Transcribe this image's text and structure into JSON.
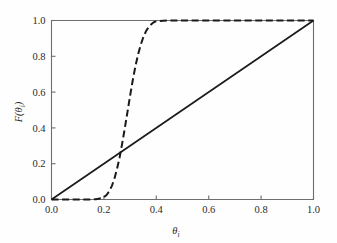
{
  "chart_data": {
    "type": "line",
    "title": "",
    "xlabel": "θi",
    "xlabel_base": "θ",
    "xlabel_sub": "i",
    "ylabel": "F(θi)",
    "ylabel_parts": {
      "func": "F",
      "open": "(",
      "base": "θ",
      "sub": "i",
      "close": ")"
    },
    "xlim": [
      0.0,
      1.0
    ],
    "ylim": [
      0.0,
      1.0
    ],
    "xticks": [
      0.0,
      0.2,
      0.4,
      0.6,
      0.8,
      1.0
    ],
    "yticks": [
      0.0,
      0.2,
      0.4,
      0.6,
      0.8,
      1.0
    ],
    "xtick_labels": [
      "0.0",
      "0.2",
      "0.4",
      "0.6",
      "0.8",
      "1.0"
    ],
    "ytick_labels": [
      "0.0",
      "0.2",
      "0.4",
      "0.6",
      "0.8",
      "1.0"
    ],
    "grid": false,
    "legend": false,
    "legend_position": "none",
    "series": [
      {
        "name": "identity",
        "style": "solid",
        "color": "#1a1a1a",
        "x": [
          0.0,
          1.0
        ],
        "values": [
          0.0,
          1.0
        ]
      },
      {
        "name": "steep-cdf",
        "style": "dashed",
        "color": "#1a1a1a",
        "x": [
          0.0,
          0.05,
          0.1,
          0.14,
          0.17,
          0.19,
          0.2,
          0.21,
          0.22,
          0.23,
          0.24,
          0.25,
          0.26,
          0.27,
          0.28,
          0.29,
          0.3,
          0.31,
          0.32,
          0.33,
          0.34,
          0.35,
          0.36,
          0.37,
          0.38,
          0.39,
          0.4,
          0.45,
          0.55,
          0.7,
          0.85,
          1.0
        ],
        "values": [
          0.0,
          0.0,
          0.0,
          0.0,
          0.002,
          0.007,
          0.013,
          0.025,
          0.045,
          0.075,
          0.115,
          0.17,
          0.235,
          0.315,
          0.4,
          0.49,
          0.58,
          0.665,
          0.742,
          0.808,
          0.862,
          0.905,
          0.938,
          0.962,
          0.978,
          0.99,
          0.997,
          1.0,
          1.0,
          1.0,
          1.0,
          1.0
        ]
      }
    ],
    "colors": {
      "axis": "#6e6e6e",
      "line": "#1a1a1a",
      "text": "#2b2b2b",
      "background": "#fefefe"
    }
  }
}
